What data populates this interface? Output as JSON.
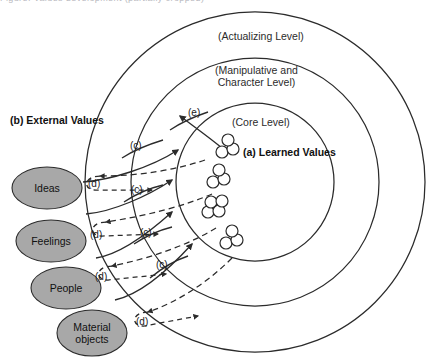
{
  "figure": {
    "type": "concentric-levels-diagram",
    "background_color": "#ffffff",
    "stroke_color": "#2b2b2b",
    "ellipse_fill": "#a8a8a8",
    "truncated_top_caption": "Figure. Values development (partially cropped)"
  },
  "levels": [
    {
      "id": "outer",
      "label": "(Actualizing Level)",
      "radius": 170
    },
    {
      "id": "middle",
      "label_line1": "(Manipulative and",
      "label_line2": "Character Level)",
      "radius": 124
    },
    {
      "id": "inner",
      "label": "(Core Level)",
      "radius": 79
    }
  ],
  "annotations": {
    "learned_values": "(a) Learned Values",
    "external_values": "(b) External Values",
    "tag_c": "(c)",
    "tag_d": "(d)",
    "tag_e": "(e)"
  },
  "sources": [
    {
      "id": "ideas",
      "label": "Ideas"
    },
    {
      "id": "feelings",
      "label": "Feelings"
    },
    {
      "id": "people",
      "label": "People"
    },
    {
      "id": "material",
      "label": "Material\nobjects"
    }
  ],
  "flow_tags": [
    {
      "tag": "(c)",
      "x": 130,
      "y": 146
    },
    {
      "tag": "(c)",
      "x": 131,
      "y": 190
    },
    {
      "tag": "(c)",
      "x": 140,
      "y": 233
    },
    {
      "tag": "(c)",
      "x": 156,
      "y": 265
    },
    {
      "tag": "(d)",
      "x": 92,
      "y": 184
    },
    {
      "tag": "(d)",
      "x": 92,
      "y": 235
    },
    {
      "tag": "(d)",
      "x": 97,
      "y": 277
    },
    {
      "tag": "(d)",
      "x": 138,
      "y": 322
    },
    {
      "tag": "(e)",
      "x": 190,
      "y": 113
    }
  ],
  "value_clusters": [
    {
      "id": "cluster-1",
      "cx": 227,
      "cy": 148,
      "count": 3
    },
    {
      "id": "cluster-2",
      "cx": 218,
      "cy": 178,
      "count": 3
    },
    {
      "id": "cluster-3",
      "cx": 213,
      "cy": 208,
      "count": 4
    },
    {
      "id": "cluster-4",
      "cx": 231,
      "cy": 239,
      "count": 3
    }
  ]
}
